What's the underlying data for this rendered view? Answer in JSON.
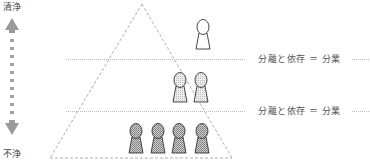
{
  "axis": {
    "top_label": "清浄",
    "bottom_label": "不浄"
  },
  "levels": [
    {
      "name": "top",
      "figures": 1,
      "style": "outline"
    },
    {
      "name": "middle",
      "figures": 2,
      "style": "light-hatched",
      "label": "分離と依存 ＝ 分業"
    },
    {
      "name": "bottom",
      "figures": 4,
      "style": "dark-hatched",
      "label": "分離と依存 ＝ 分業"
    }
  ],
  "colors": {
    "arrow": "#9a9a9a",
    "line": "#999999",
    "figure_outline": "#333333",
    "figure_light_fill": "#e6e6e6",
    "figure_dark_fill": "#b8b8b8"
  }
}
